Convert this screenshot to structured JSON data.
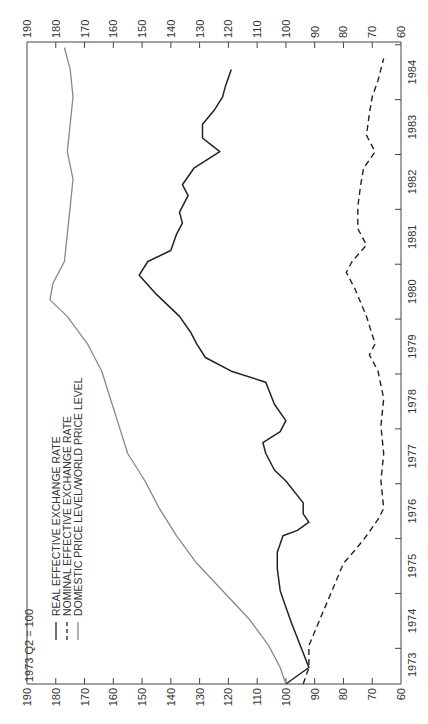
{
  "chart_data": {
    "type": "line",
    "orientation": "rotated-90-ccw",
    "title": "",
    "unit_label": "1973 Q2 = 100",
    "xlabel": "",
    "ylabel": "1973 Q2 = 100",
    "ylim": [
      60,
      190
    ],
    "y_ticks": [
      190,
      180,
      170,
      160,
      150,
      140,
      130,
      120,
      110,
      100,
      90,
      80,
      70,
      60
    ],
    "x_tick_labels": [
      "1973",
      "1974",
      "1975",
      "1976",
      "1977",
      "1978",
      "1979",
      "1980",
      "1981",
      "1982",
      "1983",
      "1984"
    ],
    "xlim": [
      1973.3,
      1985.0
    ],
    "grid": false,
    "legend_position": "upper-left (rotated)",
    "colors": {
      "real": "#222222",
      "nominal": "#222222",
      "price": "#888888",
      "axis": "#444444"
    },
    "series": [
      {
        "name": "REAL EFFECTIVE EXCHANGE RATE",
        "style": "solid",
        "x": [
          1973.3,
          1973.6,
          1974.0,
          1974.4,
          1974.7,
          1975.0,
          1975.4,
          1975.7,
          1976.0,
          1976.1,
          1976.25,
          1976.4,
          1976.6,
          1977.0,
          1977.2,
          1977.5,
          1977.7,
          1977.9,
          1978.1,
          1978.4,
          1978.8,
          1979.0,
          1979.25,
          1979.5,
          1979.7,
          1980.0,
          1980.4,
          1980.75,
          1981.0,
          1981.2,
          1981.5,
          1981.7,
          1981.9,
          1982.2,
          1982.4,
          1982.7,
          1983.0,
          1983.25,
          1983.5,
          1983.75,
          1984.0,
          1984.2,
          1984.5
        ],
        "values": [
          100,
          92,
          95,
          98,
          100,
          102,
          103,
          103,
          101,
          96,
          92,
          94,
          94,
          100,
          104,
          107,
          108,
          102,
          100,
          104,
          107,
          119,
          128,
          131,
          133,
          137,
          145,
          151,
          148,
          140,
          138,
          136,
          137,
          134,
          136,
          132,
          123,
          129,
          129,
          125,
          122,
          121,
          119
        ]
      },
      {
        "name": "NOMINAL EFFECTIVE EXCHANGE RATE",
        "style": "dashed",
        "x": [
          1973.3,
          1973.6,
          1974.0,
          1974.5,
          1975.0,
          1975.5,
          1975.8,
          1976.0,
          1976.3,
          1976.5,
          1977.0,
          1977.5,
          1978.0,
          1978.5,
          1979.0,
          1979.3,
          1979.5,
          1980.0,
          1980.5,
          1980.8,
          1981.0,
          1981.3,
          1981.6,
          1982.0,
          1982.4,
          1982.7,
          1983.0,
          1983.3,
          1983.7,
          1984.0,
          1984.3,
          1984.7
        ],
        "values": [
          94,
          92,
          92,
          88,
          84,
          80,
          75,
          72,
          68,
          66,
          67,
          66,
          67,
          66,
          68,
          71,
          69,
          72,
          76,
          79,
          77,
          72,
          75,
          75,
          74,
          73,
          69,
          72,
          71,
          70,
          68,
          66
        ]
      },
      {
        "name": "DOMESTIC PRICE LEVEL/WORLD PRICE LEVEL",
        "style": "solid-gray",
        "x": [
          1973.3,
          1973.6,
          1974.0,
          1974.5,
          1975.0,
          1975.5,
          1976.0,
          1976.5,
          1977.0,
          1977.5,
          1978.0,
          1978.5,
          1979.0,
          1979.5,
          1980.0,
          1980.3,
          1980.6,
          1981.0,
          1981.5,
          1982.0,
          1982.5,
          1983.0,
          1983.5,
          1984.0,
          1984.5,
          1984.9
        ],
        "values": [
          100,
          102,
          106,
          113,
          122,
          131,
          138,
          144,
          149,
          155,
          158,
          161,
          164,
          169,
          176,
          182,
          181,
          177,
          176,
          175,
          174,
          176,
          175,
          174,
          175,
          177
        ]
      }
    ]
  },
  "legend": {
    "items": [
      {
        "label": "REAL EFFECTIVE EXCHANGE RATE",
        "style": "solid"
      },
      {
        "label": "NOMINAL EFFECTIVE EXCHANGE RATE",
        "style": "dashed"
      },
      {
        "label": "DOMESTIC PRICE LEVEL/WORLD PRICE LEVEL",
        "style": "solid-gray"
      }
    ]
  }
}
